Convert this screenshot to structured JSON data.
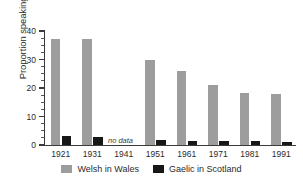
{
  "chart_data": {
    "type": "bar",
    "title": "",
    "subtitle": "",
    "xlabel": "",
    "ylabel": "Proportion speaking language (%)",
    "categories": [
      "1921",
      "1931",
      "1941",
      "1951",
      "1961",
      "1971",
      "1981",
      "1991"
    ],
    "series": [
      {
        "name": "Welsh in Wales",
        "color": "#9d9d9d",
        "values": [
          37.2,
          37.1,
          null,
          29.8,
          25.9,
          20.9,
          18.4,
          17.8
        ]
      },
      {
        "name": "Gaelic in Scotland",
        "color": "#171717",
        "values": [
          3.1,
          2.8,
          null,
          1.9,
          1.5,
          1.5,
          1.5,
          1.2
        ]
      }
    ],
    "ylim": [
      0,
      40
    ],
    "yticks": [
      0,
      10,
      20,
      30,
      40
    ],
    "ytick_labels": [
      "0",
      "10",
      "20",
      "30",
      "40"
    ],
    "yminor_step": 2.5,
    "grid": false,
    "legend_position": "bottom-center",
    "annotations": [
      {
        "text": "no data",
        "category": "1941",
        "value": 1.0,
        "style": "italic"
      }
    ]
  },
  "legend": {
    "entries": [
      {
        "label": "Welsh in Wales",
        "color": "#9d9d9d"
      },
      {
        "label": "Gaelic in Scotland",
        "color": "#171717"
      }
    ]
  },
  "colors": {
    "welsh": "#9d9d9d",
    "gaelic": "#171717",
    "axis": "#3b3b3b",
    "text": "#2b2b2b",
    "background": "#ffffff"
  }
}
